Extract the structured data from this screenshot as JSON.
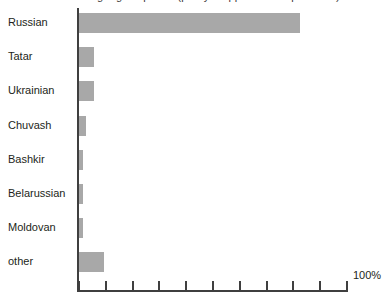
{
  "caption": {
    "text": "Languages spoken (partly cropped above plot area)",
    "visible_fragment": ""
  },
  "axis": {
    "end_label": "100%",
    "unit": "%",
    "min": 0,
    "max": 100,
    "tick_step": 10,
    "tick_count": 11
  },
  "colors": {
    "bar_fill": "#a8a8a8",
    "axis": "#3f3f3f",
    "text": "#231f20",
    "background": "#ffffff"
  },
  "chart_data": {
    "type": "bar",
    "orientation": "horizontal",
    "title": "",
    "xlabel": "",
    "ylabel": "",
    "xlim": [
      0,
      100
    ],
    "grid": false,
    "legend": false,
    "categories": [
      "Russian",
      "Tatar",
      "Ukrainian",
      "Chuvash",
      "Bashkir",
      "Belarussian",
      "Moldovan",
      "other"
    ],
    "values": [
      82.5,
      5.5,
      5.5,
      2.5,
      1.5,
      1.5,
      1.5,
      9.3
    ],
    "tick_labels": [
      "",
      "",
      "",
      "",
      "",
      "",
      "",
      "",
      "",
      "",
      "100%"
    ],
    "annotations": [
      "100%"
    ]
  }
}
